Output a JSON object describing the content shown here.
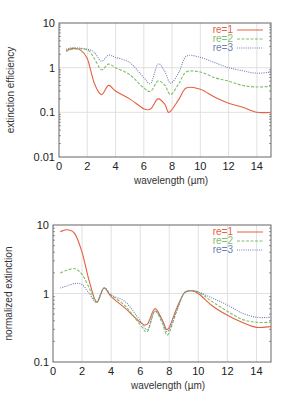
{
  "colors": {
    "re1": "#e5603f",
    "re2": "#7fbf6a",
    "re3": "#6f7fb0",
    "grid": "#d9d9d9",
    "axis": "#555555"
  },
  "chart_data": [
    {
      "type": "line",
      "title": "",
      "xlabel": "wavelength (µm)",
      "ylabel": "extinction efficiency",
      "xlim": [
        0,
        15
      ],
      "ylim": [
        0.01,
        10
      ],
      "yscale": "log",
      "x_ticks": [
        "0",
        "2",
        "4",
        "6",
        "8",
        "10",
        "12",
        "14"
      ],
      "y_ticks": [
        "0.01",
        "0.1",
        "1",
        "10"
      ],
      "grid": true,
      "legend_position": "upper right",
      "series": [
        {
          "name": "re=1",
          "style": "solid",
          "x": [
            0.5,
            1,
            1.5,
            2,
            2.5,
            3,
            3.5,
            4,
            5,
            6,
            6.5,
            7,
            7.5,
            7.8,
            8.5,
            9,
            10,
            11,
            12,
            13,
            14,
            15
          ],
          "values": [
            2.4,
            2.7,
            2.5,
            1.6,
            0.45,
            0.25,
            0.4,
            0.3,
            0.2,
            0.12,
            0.12,
            0.2,
            0.15,
            0.1,
            0.2,
            0.35,
            0.33,
            0.22,
            0.16,
            0.13,
            0.1,
            0.1
          ]
        },
        {
          "name": "re=2",
          "style": "dashed",
          "x": [
            0.5,
            1,
            2,
            2.5,
            3,
            3.5,
            4,
            5,
            6,
            6.5,
            7,
            7.5,
            7.9,
            8.5,
            9,
            10,
            11,
            12,
            13,
            14,
            15
          ],
          "values": [
            2.3,
            2.6,
            2.5,
            1.6,
            0.9,
            1.2,
            1.0,
            0.7,
            0.35,
            0.3,
            0.5,
            0.4,
            0.25,
            0.45,
            0.8,
            0.8,
            0.6,
            0.5,
            0.4,
            0.37,
            0.38
          ]
        },
        {
          "name": "re=3",
          "style": "dotted",
          "x": [
            0.5,
            1,
            2,
            2.5,
            3,
            3.5,
            4,
            5,
            6,
            6.5,
            7,
            7.5,
            7.9,
            8.5,
            9,
            10,
            11,
            12,
            13,
            14,
            15
          ],
          "values": [
            2.6,
            2.8,
            2.6,
            2.2,
            1.4,
            1.9,
            1.7,
            1.3,
            0.6,
            0.45,
            1.2,
            0.8,
            0.45,
            0.8,
            1.8,
            1.7,
            1.3,
            1.0,
            0.85,
            0.75,
            0.8
          ]
        }
      ]
    },
    {
      "type": "line",
      "title": "",
      "xlabel": "wavelength (µm)",
      "ylabel": "normalized extinction",
      "xlim": [
        0,
        15
      ],
      "ylim": [
        0.1,
        10
      ],
      "yscale": "log",
      "x_ticks": [
        "0",
        "2",
        "4",
        "6",
        "8",
        "10",
        "12",
        "14"
      ],
      "y_ticks": [
        "0.1",
        "1",
        "10"
      ],
      "grid": true,
      "legend_position": "upper right",
      "series": [
        {
          "name": "re=1",
          "style": "solid",
          "x": [
            0.5,
            1,
            1.5,
            2,
            2.5,
            3,
            3.5,
            4,
            5,
            6,
            6.5,
            7,
            7.5,
            7.9,
            8.5,
            9,
            9.5,
            10,
            11,
            12,
            13,
            14,
            15
          ],
          "values": [
            8,
            8.5,
            7.5,
            4,
            1.5,
            0.75,
            1.2,
            0.9,
            0.6,
            0.38,
            0.36,
            0.6,
            0.42,
            0.3,
            0.6,
            1.0,
            1.1,
            1.0,
            0.65,
            0.48,
            0.38,
            0.32,
            0.33
          ]
        },
        {
          "name": "re=2",
          "style": "dashed",
          "x": [
            0.5,
            1,
            1.5,
            2,
            2.5,
            3,
            3.5,
            4,
            5,
            6,
            6.5,
            7,
            7.5,
            7.9,
            8.5,
            9,
            9.5,
            10,
            11,
            12,
            13,
            14,
            15
          ],
          "values": [
            2,
            2.2,
            2.3,
            1.9,
            1.2,
            0.75,
            1.2,
            0.95,
            0.65,
            0.35,
            0.28,
            0.55,
            0.38,
            0.25,
            0.55,
            1.0,
            1.1,
            1.05,
            0.75,
            0.55,
            0.42,
            0.38,
            0.38
          ]
        },
        {
          "name": "re=3",
          "style": "dotted",
          "x": [
            0.5,
            1,
            1.5,
            2,
            2.5,
            3,
            3.5,
            4,
            5,
            6,
            6.5,
            7,
            7.5,
            7.9,
            8.5,
            9,
            9.5,
            10,
            11,
            12,
            13,
            14,
            15
          ],
          "values": [
            1.2,
            1.3,
            1.4,
            1.35,
            1.0,
            0.75,
            1.2,
            0.95,
            0.75,
            0.4,
            0.3,
            0.55,
            0.4,
            0.28,
            0.55,
            1.0,
            1.1,
            1.05,
            0.85,
            0.68,
            0.52,
            0.45,
            0.45
          ]
        }
      ]
    }
  ],
  "layout": [
    {
      "left": 59,
      "right": 271,
      "top": 23,
      "bottom": 157
    },
    {
      "left": 53,
      "right": 271,
      "top": 225,
      "bottom": 362
    }
  ]
}
